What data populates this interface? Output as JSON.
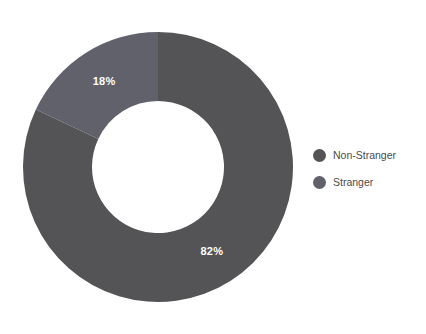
{
  "chart_data": {
    "type": "pie",
    "variant": "donut",
    "title": "",
    "subtitle": "",
    "xlabel": "",
    "ylabel": "",
    "grid": false,
    "legend_position": "right",
    "categories": [
      "Non-Stranger",
      "Stranger"
    ],
    "values": [
      82,
      18
    ],
    "unit": "%",
    "data_labels": [
      "82%",
      "18%"
    ],
    "colors": [
      "#545456",
      "#60six"
    ],
    "series": [
      {
        "name": "Share",
        "values": [
          82,
          18
        ]
      }
    ],
    "slices": [
      {
        "label": "Non-Stranger",
        "value": 82,
        "data_label": "82%",
        "color": "#545456"
      },
      {
        "label": "Stranger",
        "value": 18,
        "data_label": "18%",
        "color": "#60616a"
      }
    ]
  },
  "chart": {
    "background": "#ffffff",
    "label_color": "#ffffff",
    "center_x": 158,
    "center_y": 167,
    "outer_radius": 135,
    "inner_radius": 66,
    "labels": {
      "non_stranger": "82%",
      "stranger": "18%"
    }
  },
  "legend": {
    "items": [
      {
        "label": "Non-Stranger",
        "color": "#545456"
      },
      {
        "label": "Stranger",
        "color": "#60616a"
      }
    ]
  }
}
